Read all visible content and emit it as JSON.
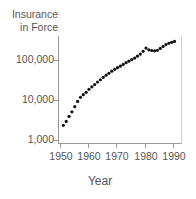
{
  "chart_data": {
    "type": "scatter",
    "title": "",
    "ylabel": "Insurance in Force",
    "xlabel": "Year",
    "yscale": "log",
    "ylim": [
      1000,
      400000
    ],
    "xlim": [
      1949,
      1993
    ],
    "grid": false,
    "legend": null,
    "x_ticks": [
      1950,
      1960,
      1970,
      1980,
      1990
    ],
    "y_ticks": [
      1000,
      10000,
      100000
    ],
    "x": [
      1951,
      1952,
      1953,
      1954,
      1955,
      1956,
      1957,
      1958,
      1959,
      1960,
      1961,
      1962,
      1963,
      1964,
      1965,
      1966,
      1967,
      1968,
      1969,
      1970,
      1971,
      1972,
      1973,
      1974,
      1975,
      1976,
      1977,
      1978,
      1979,
      1980,
      1981,
      1982,
      1983,
      1984,
      1985,
      1986,
      1987,
      1988,
      1989,
      1990
    ],
    "values": [
      2400,
      3000,
      4000,
      5200,
      7000,
      9500,
      12000,
      14000,
      16000,
      19000,
      22000,
      25000,
      29000,
      33000,
      38000,
      43000,
      48000,
      54000,
      60000,
      66000,
      72000,
      80000,
      88000,
      96000,
      105000,
      115000,
      128000,
      145000,
      170000,
      205000,
      185000,
      178000,
      175000,
      180000,
      200000,
      225000,
      250000,
      270000,
      285000,
      300000
    ]
  },
  "labels": {
    "ylabel_line1": "Insurance",
    "ylabel_line2": "in Force",
    "xlabel": "Year",
    "yticks": [
      "100,000",
      "10,000",
      "1,000"
    ],
    "xticks": [
      "1950",
      "1960",
      "1970",
      "1980",
      "1990"
    ]
  }
}
